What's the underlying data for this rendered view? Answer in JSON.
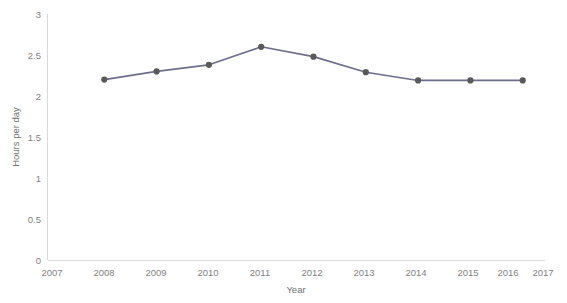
{
  "chart_data": {
    "type": "line",
    "title": "",
    "xlabel": "Year",
    "ylabel": "Hours per day",
    "x": [
      2008,
      2009,
      2010,
      2011,
      2012,
      2013,
      2014,
      2015,
      2016
    ],
    "values": [
      2.2,
      2.3,
      2.38,
      2.6,
      2.48,
      2.29,
      2.19,
      2.19,
      2.19
    ],
    "series": [
      {
        "name": "Hours per day",
        "values": [
          2.2,
          2.3,
          2.38,
          2.6,
          2.48,
          2.29,
          2.19,
          2.19,
          2.19
        ]
      }
    ],
    "xlim": [
      2007,
      2017
    ],
    "ylim": [
      0,
      3
    ],
    "xticks": [
      2007,
      2008,
      2009,
      2010,
      2011,
      2012,
      2013,
      2014,
      2015,
      2016,
      2017
    ],
    "xtick_labels": [
      "2007",
      "2008",
      "2009",
      "2010",
      "2011",
      "2012",
      "2013",
      "2014",
      "2015",
      "2016",
      "2017"
    ],
    "yticks": [
      0,
      0.5,
      1,
      1.5,
      2,
      2.5,
      3
    ],
    "ytick_labels": [
      "0",
      "0.5",
      "1",
      "1.5",
      "2",
      "2.5",
      "3"
    ],
    "grid": false,
    "legend": "none",
    "marker": "circle",
    "line_color": "#6d6d8c",
    "marker_color": "#595959",
    "axis_color": "#d9d9d9",
    "tick_label_color": "#7f7f7f"
  }
}
